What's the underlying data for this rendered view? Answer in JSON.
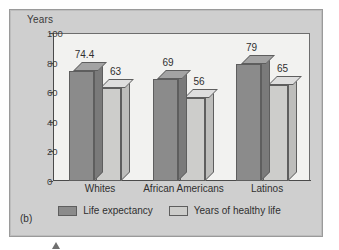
{
  "figure": {
    "label": "(b)"
  },
  "chart_data": {
    "type": "bar",
    "title": "",
    "ylabel": "Years",
    "xlabel": "",
    "ylim": [
      0,
      100
    ],
    "yticks": [
      0,
      20,
      40,
      60,
      80,
      100
    ],
    "grid": false,
    "legend_position": "bottom",
    "categories": [
      "Whites",
      "African Americans",
      "Latinos"
    ],
    "series": [
      {
        "name": "Life expectancy",
        "color": "#8b8b8b",
        "values": [
          74.4,
          69,
          79
        ],
        "labels": [
          "74.4",
          "69",
          "79"
        ]
      },
      {
        "name": "Years of healthy life",
        "color": "#cdcdcb",
        "values": [
          63,
          56,
          65
        ],
        "labels": [
          "63",
          "56",
          "65"
        ]
      }
    ]
  }
}
